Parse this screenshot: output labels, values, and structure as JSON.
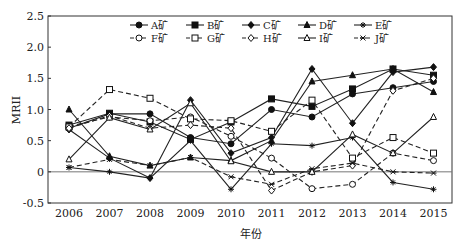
{
  "chart_data": {
    "type": "line",
    "title": "",
    "xlabel": "年份",
    "ylabel": "MRII",
    "ylim": [
      -0.5,
      2.5
    ],
    "yticks": [
      "-0.5",
      "0",
      "0.5",
      "1.0",
      "1.5",
      "2.0",
      "2.5"
    ],
    "x": [
      "2006",
      "2007",
      "2008",
      "2009",
      "2010",
      "2011",
      "2012",
      "2013",
      "2014",
      "2015"
    ],
    "grid": false,
    "legend_position": "top, inside plot, 2 rows",
    "reference_line": 0,
    "series": [
      {
        "name": "A矿",
        "marker": "filled-circle",
        "dash": false,
        "values": [
          0.7,
          0.93,
          0.93,
          0.55,
          0.45,
          1.0,
          0.88,
          1.25,
          1.35,
          1.45
        ]
      },
      {
        "name": "B矿",
        "marker": "filled-square",
        "dash": false,
        "values": [
          0.75,
          0.94,
          0.8,
          0.52,
          0.8,
          1.17,
          1.05,
          1.33,
          1.65,
          1.55
        ]
      },
      {
        "name": "C矿",
        "marker": "filled-diamond",
        "dash": false,
        "values": [
          0.68,
          0.22,
          -0.1,
          1.15,
          0.3,
          0.55,
          1.65,
          0.78,
          1.6,
          1.68
        ]
      },
      {
        "name": "D矿",
        "marker": "filled-triangle",
        "dash": false,
        "values": [
          1.0,
          0.25,
          0.1,
          0.23,
          0.18,
          0.5,
          1.45,
          1.55,
          1.65,
          1.28
        ]
      },
      {
        "name": "E矿",
        "marker": "star",
        "dash": false,
        "values": [
          0.07,
          0.0,
          -0.1,
          0.5,
          -0.28,
          0.45,
          0.42,
          0.55,
          -0.17,
          -0.28
        ]
      },
      {
        "name": "F矿",
        "marker": "open-circle",
        "dash": true,
        "values": [
          0.73,
          0.88,
          0.82,
          0.88,
          0.57,
          0.22,
          -0.27,
          -0.2,
          0.3,
          0.18
        ]
      },
      {
        "name": "G矿",
        "marker": "open-square",
        "dash": true,
        "values": [
          0.72,
          1.32,
          1.18,
          0.85,
          0.82,
          0.65,
          1.15,
          0.22,
          0.55,
          0.3
        ]
      },
      {
        "name": "H矿",
        "marker": "open-diamond",
        "dash": true,
        "values": [
          0.7,
          0.9,
          0.7,
          0.75,
          0.7,
          -0.3,
          0.0,
          0.1,
          1.3,
          1.5
        ]
      },
      {
        "name": "I矿",
        "marker": "open-triangle",
        "dash": false,
        "values": [
          0.2,
          0.87,
          0.68,
          1.1,
          0.17,
          0.0,
          0.0,
          0.6,
          0.3,
          0.88
        ]
      },
      {
        "name": "J矿",
        "marker": "x-star",
        "dash": true,
        "values": [
          0.07,
          0.2,
          0.1,
          0.23,
          -0.08,
          -0.2,
          0.05,
          0.14,
          0.0,
          -0.02
        ]
      }
    ]
  }
}
